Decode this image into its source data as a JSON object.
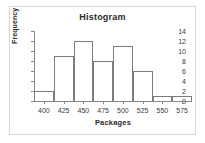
{
  "chart_data": {
    "type": "bar",
    "title": "Histogram",
    "xlabel": "Packages",
    "ylabel": "Frequency",
    "categories": [
      "400",
      "425",
      "450",
      "475",
      "500",
      "525",
      "550",
      "575"
    ],
    "values": [
      2,
      9,
      12,
      8,
      11,
      6,
      1,
      1
    ],
    "bin_edges": [
      387.5,
      412.5,
      437.5,
      462.5,
      487.5,
      512.5,
      537.5,
      562.5,
      587.5
    ],
    "bin_width": 25,
    "xlim": [
      387.5,
      587.5
    ],
    "ylim": [
      0,
      14
    ],
    "ytick_labels": [
      "0",
      "2",
      "4",
      "6",
      "8",
      "10",
      "12",
      "14"
    ],
    "ytick_values": [
      0,
      2,
      4,
      6,
      8,
      10,
      12,
      14
    ],
    "xtick_labels": [
      "400",
      "425",
      "450",
      "475",
      "500",
      "525",
      "550",
      "575"
    ],
    "xtick_values": [
      400,
      425,
      450,
      475,
      500,
      525,
      550,
      575
    ],
    "grid": false,
    "legend": false,
    "bar_fill_color": "#ffffff",
    "bar_edge_color": "#7d7d7d",
    "axis_color": "#8a8a8a",
    "text_color": "#2b2b2b",
    "background_color": "#ffffff",
    "frame_color": "#d7d7d7"
  }
}
